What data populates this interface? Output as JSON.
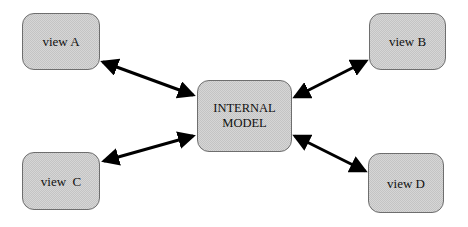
{
  "diagram": {
    "center": {
      "label_line1": "INTERNAL",
      "label_line2": "MODEL"
    },
    "views": [
      {
        "id": "A",
        "label": "view A"
      },
      {
        "id": "B",
        "label": "view B"
      },
      {
        "id": "C",
        "label": "view  C"
      },
      {
        "id": "D",
        "label": "view D"
      }
    ],
    "edges": [
      {
        "from": "view A",
        "to": "INTERNAL MODEL",
        "type": "bidirectional"
      },
      {
        "from": "view B",
        "to": "INTERNAL MODEL",
        "type": "bidirectional"
      },
      {
        "from": "view C",
        "to": "INTERNAL MODEL",
        "type": "bidirectional"
      },
      {
        "from": "view D",
        "to": "INTERNAL MODEL",
        "type": "bidirectional"
      }
    ],
    "colors": {
      "node_fill": "#d6d6d6",
      "node_border": "#6e6e6e",
      "arrow": "#000000"
    }
  }
}
